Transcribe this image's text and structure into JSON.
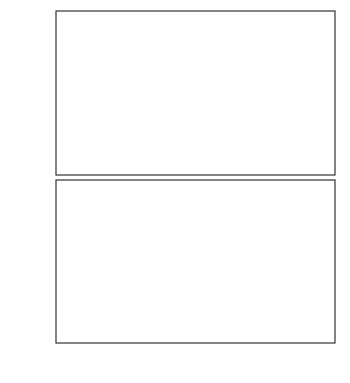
{
  "chart_data": [
    {
      "type": "scatter",
      "panel": "top",
      "title": "",
      "xlabel": "M_V",
      "ylabel": "i",
      "xlim": [
        -6,
        8
      ],
      "ylim": [
        66,
        75.9
      ],
      "xticks": [
        -6,
        -4,
        -2,
        0,
        2,
        4,
        6,
        8
      ],
      "yticks": [
        68,
        70,
        72,
        74
      ],
      "ytick_labels": [
        "68",
        "70",
        "72",
        "74"
      ],
      "grid": false,
      "reference_lines": [
        {
          "y": 72.75,
          "x_range": [
            -5.5,
            1
          ],
          "style": "dashed"
        },
        {
          "y": 70.85,
          "x_range": [
            -5.5,
            1
          ],
          "style": "dashed"
        }
      ],
      "points": [
        {
          "x": -4.5,
          "y": 71.6,
          "err": 0.2
        },
        {
          "x": -4.3,
          "y": 72.4,
          "err": 0.3
        },
        {
          "x": -3.8,
          "y": 70.75,
          "err": 0.2
        },
        {
          "x": -3.7,
          "y": 72.8,
          "err": 0.4
        },
        {
          "x": -3.5,
          "y": 71.45,
          "err": 1.4
        },
        {
          "x": -2.9,
          "y": 71.9,
          "err": 0.9
        },
        {
          "x": -2.3,
          "y": 71.1,
          "err": 0.8
        },
        {
          "x": -2.3,
          "y": 70.65,
          "err": 0.95
        },
        {
          "x": -2.0,
          "y": 71.05,
          "err": 1.2
        },
        {
          "x": -1.9,
          "y": 73.3,
          "err": 0.3
        },
        {
          "x": -1.9,
          "y": 72.7,
          "err": 0.4
        },
        {
          "x": -1.7,
          "y": 72.9,
          "err": 0.4
        },
        {
          "x": -1.5,
          "y": 74.0,
          "err": 1.3
        },
        {
          "x": -1.5,
          "y": 73.3,
          "err": 0.5
        },
        {
          "x": -1.4,
          "y": 72.85,
          "err": 0.6
        },
        {
          "x": -1.35,
          "y": 72.5,
          "err": 0.5
        },
        {
          "x": -1.3,
          "y": 72.2,
          "err": 0.6
        },
        {
          "x": -1.3,
          "y": 71.1,
          "err": 1.5
        },
        {
          "x": -1.2,
          "y": 72.6,
          "err": 0.4
        },
        {
          "x": -1.2,
          "y": 71.0,
          "err": 0.3
        },
        {
          "x": -0.9,
          "y": 73.3,
          "err": 1.1
        },
        {
          "x": -0.5,
          "y": 72.4,
          "err": 0.5
        },
        {
          "x": -0.5,
          "y": 71.9,
          "err": 0.5
        },
        {
          "x": -0.5,
          "y": 71.05,
          "err": 0.5
        },
        {
          "x": -0.1,
          "y": 73.3,
          "err": 0.5
        },
        {
          "x": 0.1,
          "y": 70.8,
          "err": 0.3
        },
        {
          "x": 0.3,
          "y": 72.15,
          "err": 1.4
        },
        {
          "x": 0.4,
          "y": 70.2,
          "err": 1.5
        },
        {
          "x": 0.5,
          "y": 75.05,
          "err": 0.4
        },
        {
          "x": 0.9,
          "y": 72.5,
          "err": 0.2
        },
        {
          "x": 1.0,
          "y": 71.15,
          "err": 0.3
        },
        {
          "x": 1.8,
          "y": 71.6,
          "err": 1.5
        },
        {
          "x": 1.9,
          "y": 73.3,
          "err": 0.5
        },
        {
          "x": 3.0,
          "y": 74.0,
          "err": 0.4
        },
        {
          "x": 3.0,
          "y": 71.2,
          "err": 0.5
        },
        {
          "x": 3.0,
          "y": 70.4,
          "err": 0.3
        },
        {
          "x": 3.0,
          "y": 69.85,
          "err": 0.5
        },
        {
          "x": 4.0,
          "y": 73.4,
          "err": 2.0
        },
        {
          "x": 4.0,
          "y": 73.1,
          "err": 2.0
        },
        {
          "x": 4.0,
          "y": 72.1,
          "err": 2.0
        },
        {
          "x": 4.0,
          "y": 71.9,
          "err": 2.0
        },
        {
          "x": 4.0,
          "y": 71.65,
          "err": 2.0
        },
        {
          "x": 4.0,
          "y": 71.5,
          "err": 2.0
        },
        {
          "x": 4.0,
          "y": 69.35,
          "err": 2.0
        },
        {
          "x": 4.0,
          "y": 68.9,
          "err": 2.0
        },
        {
          "x": 4.0,
          "y": 68.5,
          "err": 2.0
        },
        {
          "x": 5.0,
          "y": 73.1,
          "err": 0.5
        },
        {
          "x": 5.0,
          "y": 72.0,
          "err": 1.1
        },
        {
          "x": 5.0,
          "y": 71.95,
          "err": 1.0
        },
        {
          "x": 5.0,
          "y": 70.35,
          "err": 0.5
        },
        {
          "x": 5.0,
          "y": 69.5,
          "err": 0.5
        },
        {
          "x": 5.0,
          "y": 68.0,
          "err": 0.6
        },
        {
          "x": 6.0,
          "y": 73.05,
          "err": 1.1
        },
        {
          "x": 6.0,
          "y": 72.35,
          "err": 1.2
        },
        {
          "x": 6.0,
          "y": 71.9,
          "err": 1.2
        },
        {
          "x": 6.0,
          "y": 68.7,
          "err": 0.8
        },
        {
          "x": 7.0,
          "y": 74.2,
          "err": 0.7
        },
        {
          "x": 7.0,
          "y": 69.6,
          "err": 2.3
        }
      ]
    },
    {
      "type": "scatter",
      "panel": "bottom",
      "title": "",
      "xlabel": "M_V",
      "ylabel": "1/a",
      "xlim": [
        -6,
        8
      ],
      "ylim": [
        0.155,
        0.495
      ],
      "xticks": [
        -6,
        -4,
        -2,
        0,
        2,
        4,
        6,
        8
      ],
      "xtick_labels": [
        "-6",
        "-4",
        "-2",
        "0",
        "2",
        "4",
        "6",
        "8"
      ],
      "yticks": [
        0.2,
        0.3,
        0.4
      ],
      "ytick_labels": [
        "0.20",
        "0.30",
        "0.40"
      ],
      "grid": false,
      "reference_lines": [
        {
          "y": 0.322,
          "x_range": [
            -5.5,
            6
          ],
          "style": "dashed"
        }
      ],
      "points": [
        {
          "x": -4.5,
          "y": 0.328,
          "err": 0.01
        },
        {
          "x": -4.3,
          "y": 0.33,
          "err": 0.02
        },
        {
          "x": -3.8,
          "y": 0.307,
          "err": 0.01
        },
        {
          "x": -3.7,
          "y": 0.297,
          "err": 0.02
        },
        {
          "x": -3.6,
          "y": 0.247,
          "err": 0.01
        },
        {
          "x": -3.1,
          "y": 0.262,
          "err": 0.05
        },
        {
          "x": -2.8,
          "y": 0.323,
          "err": 0.055
        },
        {
          "x": -2.8,
          "y": 0.31,
          "err": 0.04
        },
        {
          "x": -2.5,
          "y": 0.322,
          "err": 0.02
        },
        {
          "x": -2.5,
          "y": 0.303,
          "err": 0.03
        },
        {
          "x": -2.3,
          "y": 0.297,
          "err": 0.04
        },
        {
          "x": -2.2,
          "y": 0.296,
          "err": 0.03
        },
        {
          "x": -2.0,
          "y": 0.336,
          "err": 0.04
        },
        {
          "x": -1.9,
          "y": 0.37,
          "err": 0.01
        },
        {
          "x": -1.9,
          "y": 0.322,
          "err": 0.04
        },
        {
          "x": -1.8,
          "y": 0.296,
          "err": 0.04
        },
        {
          "x": -1.9,
          "y": 0.225,
          "err": 0.01
        },
        {
          "x": -1.7,
          "y": 0.33,
          "err": 0.01
        },
        {
          "x": -1.6,
          "y": 0.32,
          "err": 0.02
        },
        {
          "x": -1.3,
          "y": 0.361,
          "err": 0.01
        },
        {
          "x": -1.3,
          "y": 0.327,
          "err": 0.02
        },
        {
          "x": -1.3,
          "y": 0.294,
          "err": 0.02
        },
        {
          "x": -1.3,
          "y": 0.268,
          "err": 0.04
        },
        {
          "x": -1.0,
          "y": 0.286,
          "err": 0.03
        },
        {
          "x": -0.9,
          "y": 0.31,
          "err": 0.03
        },
        {
          "x": -0.6,
          "y": 0.31,
          "err": 0.04
        },
        {
          "x": -0.1,
          "y": 0.328,
          "err": 0.01
        },
        {
          "x": 0.1,
          "y": 0.373,
          "err": 0.02
        },
        {
          "x": 0.9,
          "y": 0.168,
          "err": 0.1
        },
        {
          "x": 1.0,
          "y": 0.304,
          "err": 0.04
        },
        {
          "x": 2.0,
          "y": 0.381,
          "err": 0.03
        },
        {
          "x": 2.0,
          "y": 0.374,
          "err": 0.03
        },
        {
          "x": 2.0,
          "y": 0.362,
          "err": 0.03
        },
        {
          "x": 2.0,
          "y": 0.275,
          "err": 0.03
        },
        {
          "x": 3.0,
          "y": 0.414,
          "err": 0.06
        },
        {
          "x": 3.0,
          "y": 0.371,
          "err": 0.06
        },
        {
          "x": 3.0,
          "y": 0.365,
          "err": 0.06
        },
        {
          "x": 3.0,
          "y": 0.345,
          "err": 0.06
        },
        {
          "x": 3.0,
          "y": 0.323,
          "err": 0.06
        },
        {
          "x": 3.0,
          "y": 0.31,
          "err": 0.06
        },
        {
          "x": 3.0,
          "y": 0.303,
          "err": 0.06
        },
        {
          "x": 3.0,
          "y": 0.298,
          "err": 0.06
        },
        {
          "x": 3.0,
          "y": 0.229,
          "err": 0.08
        },
        {
          "x": 4.0,
          "y": 0.485,
          "err": 0.12
        },
        {
          "x": 4.0,
          "y": 0.398,
          "err": 0.12
        },
        {
          "x": 4.0,
          "y": 0.378,
          "err": 0.12
        },
        {
          "x": 4.0,
          "y": 0.358,
          "err": 0.12
        },
        {
          "x": 4.0,
          "y": 0.345,
          "err": 0.12
        },
        {
          "x": 4.0,
          "y": 0.274,
          "err": 0.12
        },
        {
          "x": 5.0,
          "y": 0.346,
          "err": 0.03
        },
        {
          "x": 5.0,
          "y": 0.303,
          "err": 0.06
        },
        {
          "x": 5.0,
          "y": 0.238,
          "err": 0.06
        },
        {
          "x": 6.0,
          "y": 0.453,
          "err": 0.06
        },
        {
          "x": 6.0,
          "y": 0.289,
          "err": 0.04
        }
      ]
    }
  ],
  "figure": {
    "top_panel": {
      "ylabel": "i",
      "ytick_labels": [
        "74",
        "72",
        "70",
        "68"
      ]
    },
    "bottom_panel": {
      "ylabel": "1/a",
      "ytick_labels": [
        "0.40",
        "0.30",
        "0.20"
      ]
    },
    "xaxis": {
      "label_main": "M",
      "label_sub": "V",
      "tick_labels": [
        "-6",
        "-4",
        "-2",
        "0",
        "2",
        "4",
        "6",
        "8"
      ]
    },
    "colors": {
      "marker": "#000000",
      "axis": "#333333",
      "text": "#333333"
    }
  }
}
